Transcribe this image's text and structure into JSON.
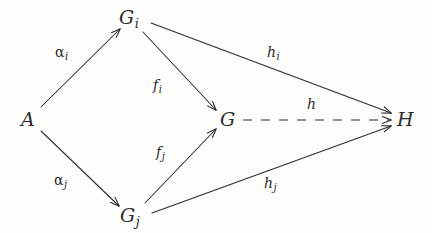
{
  "diagram": {
    "type": "commutative-diagram",
    "title": "",
    "background_color": "#fdfdfc",
    "ink_color": "#2b2b2b",
    "nodes": [
      {
        "id": "A",
        "label": "A",
        "sub": "",
        "x": 28,
        "y": 119
      },
      {
        "id": "Gi",
        "label": "G",
        "sub": "i",
        "x": 131,
        "y": 17
      },
      {
        "id": "Gj",
        "label": "G",
        "sub": "j",
        "x": 133,
        "y": 216
      },
      {
        "id": "G",
        "label": "G",
        "sub": "",
        "x": 227,
        "y": 119
      },
      {
        "id": "H",
        "label": "H",
        "sub": "",
        "x": 404,
        "y": 119
      }
    ],
    "edges": [
      {
        "id": "alpha_i",
        "from": "A",
        "to": "Gi",
        "label": "α",
        "sub": "i",
        "style": "solid",
        "label_x": 64,
        "label_y": 53
      },
      {
        "id": "alpha_j",
        "from": "A",
        "to": "Gj",
        "label": "α",
        "sub": "j",
        "style": "solid",
        "label_x": 63,
        "label_y": 181
      },
      {
        "id": "f_i",
        "from": "Gi",
        "to": "G",
        "label": "f",
        "sub": "i",
        "style": "solid",
        "label_x": 159,
        "label_y": 86
      },
      {
        "id": "f_j",
        "from": "Gj",
        "to": "G",
        "label": "f",
        "sub": "j",
        "style": "solid",
        "label_x": 162,
        "label_y": 153
      },
      {
        "id": "h_i",
        "from": "Gi",
        "to": "H",
        "label": "h",
        "sub": "i",
        "style": "solid",
        "label_x": 274,
        "label_y": 53
      },
      {
        "id": "h_j",
        "from": "Gj",
        "to": "H",
        "label": "h",
        "sub": "j",
        "style": "solid",
        "label_x": 271,
        "label_y": 184
      },
      {
        "id": "h",
        "from": "G",
        "to": "H",
        "label": "h",
        "sub": "",
        "style": "dashed",
        "label_x": 311,
        "label_y": 105
      }
    ]
  }
}
